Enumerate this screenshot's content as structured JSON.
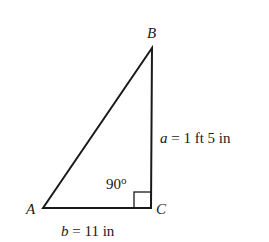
{
  "diagram": {
    "type": "right-triangle",
    "vertices": {
      "A": {
        "label": "A",
        "x": 43,
        "y": 208
      },
      "B": {
        "label": "B",
        "x": 152,
        "y": 48
      },
      "C": {
        "label": "C",
        "x": 151,
        "y": 208
      }
    },
    "angle_label": "90°",
    "angle_value": "90",
    "angle_degree": "o",
    "sides": {
      "a": {
        "var": "a",
        "text": " = 1 ft 5 in"
      },
      "b": {
        "var": "b",
        "text": " = 11 in"
      }
    },
    "stroke_color": "#1a1a1a"
  }
}
